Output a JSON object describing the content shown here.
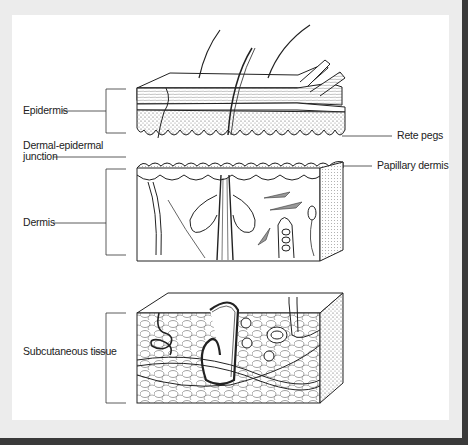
{
  "figure": {
    "type": "anatomical illustration",
    "colors": {
      "background": "#ececec",
      "panel": "#ffffff",
      "frame": "#3a3a3a",
      "ink": "#222222"
    }
  },
  "labels": {
    "epidermis": "Epidermis",
    "dermal_epidermal_junction_line1": "Dermal-epidermal",
    "dermal_epidermal_junction_line2": "junction",
    "dermis": "Dermis",
    "subcutaneous_tissue": "Subcutaneous tissue",
    "rete_pegs": "Rete pegs",
    "papillary_dermis": "Papillary dermis"
  },
  "blocks": [
    {
      "name": "epidermis-block",
      "label_ref": "epidermis"
    },
    {
      "name": "dermis-block",
      "label_ref": "dermis"
    },
    {
      "name": "subcutaneous-block",
      "label_ref": "subcutaneous_tissue"
    }
  ]
}
